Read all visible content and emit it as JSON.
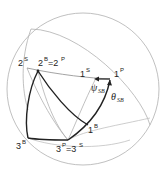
{
  "diagram": {
    "type": "spherical-geometry",
    "colors": {
      "thin_line": "#a8a8a8",
      "thick_line": "#222222",
      "text": "#222222"
    },
    "labels": {
      "s2": {
        "base": "2",
        "sup": "S"
      },
      "b2p2": {
        "base": "2",
        "sup": "B",
        "eq": "=2",
        "sup2": "P"
      },
      "s1": {
        "base": "1",
        "sup": "S"
      },
      "p1": {
        "base": "1",
        "sup": "P"
      },
      "psi": {
        "symbol": "ψ",
        "sub": "SB"
      },
      "theta": {
        "symbol": "θ",
        "sub": "SB"
      },
      "b1": {
        "base": "1",
        "sup": "B"
      },
      "b3": {
        "base": "3",
        "sup": "B"
      },
      "p3s3": {
        "base": "3",
        "sup": "P",
        "eq": "=3",
        "sup2": "S"
      }
    }
  }
}
